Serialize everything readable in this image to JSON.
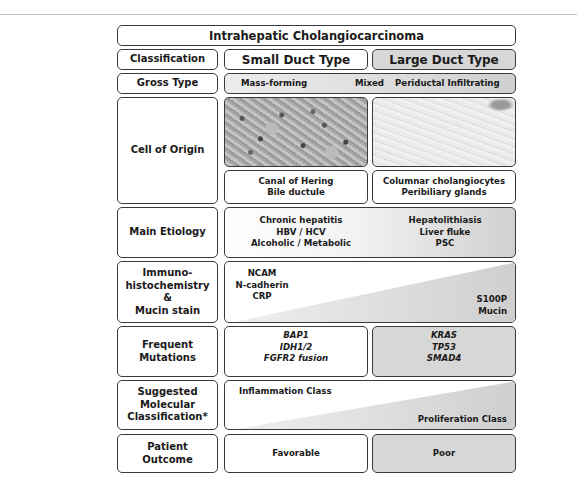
{
  "title": "Intrahepatic Cholangiocarcinoma",
  "rows": {
    "classification": {
      "label": "Classification",
      "small": "Small Duct Type",
      "large": "Large Duct Type"
    },
    "gross_type": {
      "label": "Gross Type",
      "items": [
        "Mass-forming",
        "Mixed",
        "Periductal Infiltrating"
      ]
    },
    "cell_of_origin": {
      "label": "Cell of Origin",
      "small": [
        "Canal of Hering",
        "Bile ductule"
      ],
      "large": [
        "Columnar cholangiocytes",
        "Peribiliary glands"
      ]
    },
    "main_etiology": {
      "label": "Main Etiology",
      "small": [
        "Chronic hepatitis",
        "HBV / HCV",
        "Alcoholic / Metabolic"
      ],
      "large": [
        "Hepatolithiasis",
        "Liver fluke",
        "PSC"
      ]
    },
    "immuno": {
      "label": [
        "Immuno-",
        "histochemistry",
        "&",
        "Mucin stain"
      ],
      "small": [
        "NCAM",
        "N-cadherin",
        "CRP"
      ],
      "large": [
        "S100P",
        "Mucin"
      ]
    },
    "mutations": {
      "label": [
        "Frequent",
        "Mutations"
      ],
      "small": [
        "BAP1",
        "IDH1/2",
        "FGFR2 fusion"
      ],
      "large": [
        "KRAS",
        "TP53",
        "SMAD4"
      ]
    },
    "molecular": {
      "label": [
        "Suggested",
        "Molecular",
        "Classification*"
      ],
      "small": "Inflammation Class",
      "large": "Proliferation Class"
    },
    "outcome": {
      "label": [
        "Patient",
        "Outcome"
      ],
      "small": "Favorable",
      "large": "Poor"
    }
  },
  "colors": {
    "border": "#3a3a3a",
    "gray_fill": "#d7d7d7",
    "white": "#ffffff"
  }
}
